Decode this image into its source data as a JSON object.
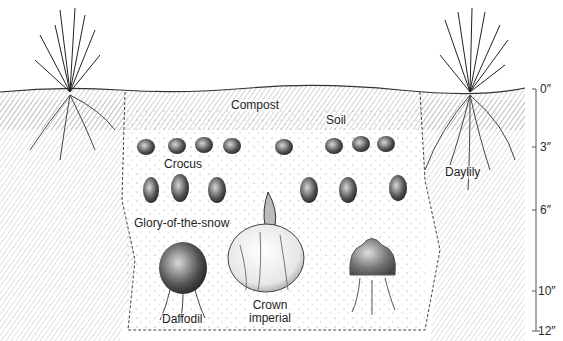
{
  "diagram": {
    "title": "",
    "type": "bulb planting depth cross-section",
    "layers": {
      "compost_label": "Compost",
      "soil_label": "Soil"
    },
    "plants": {
      "crocus": "Crocus",
      "glory": "Glory-of-the-snow",
      "daffodil": "Daffodil",
      "crown_imperial_line1": "Crown",
      "crown_imperial_line2": "imperial",
      "daylily": "Daylily"
    },
    "depth_scale": {
      "unit": "inches",
      "ticks": [
        {
          "label": "0″",
          "depth": 0
        },
        {
          "label": "3″",
          "depth": 3
        },
        {
          "label": "6″",
          "depth": 6
        },
        {
          "label": "10″",
          "depth": 10
        },
        {
          "label": "12″",
          "depth": 12
        }
      ]
    },
    "colors": {
      "ink": "#1a1a1a",
      "hatch": "#6a6a6a",
      "paper": "#ffffff"
    }
  }
}
